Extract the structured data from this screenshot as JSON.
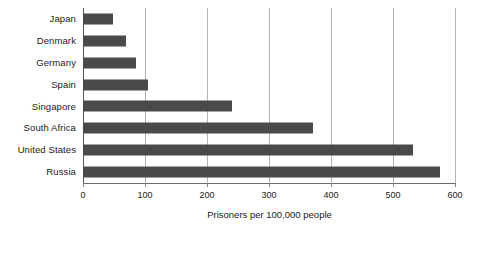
{
  "chart_data": {
    "type": "bar",
    "orientation": "horizontal",
    "title": "",
    "subtitle": "",
    "xlabel": "Prisoners per 100,000 people",
    "ylabel": "",
    "categories": [
      "Japan",
      "Denmark",
      "Germany",
      "Spain",
      "Singapore",
      "South Africa",
      "United States",
      "Russia"
    ],
    "values": [
      48,
      69,
      85,
      105,
      240,
      371,
      532,
      575
    ],
    "series": [
      {
        "name": "Prisoners per 100,000 people",
        "values": [
          48,
          69,
          85,
          105,
          240,
          371,
          532,
          575
        ]
      }
    ],
    "xlim": [
      0,
      600
    ],
    "xticks": [
      0,
      100,
      200,
      300,
      400,
      500,
      600
    ],
    "xtick_labels": [
      "0",
      "100",
      "200",
      "300",
      "400",
      "500",
      "600"
    ],
    "grid": "vertical",
    "legend": "none",
    "bar_color": "#4a4a4a",
    "gridline_color": "#b4b4b4",
    "axis_color": "#6a6a6a",
    "background_color": "#ffffff",
    "text_color": "#1a1a1a"
  }
}
